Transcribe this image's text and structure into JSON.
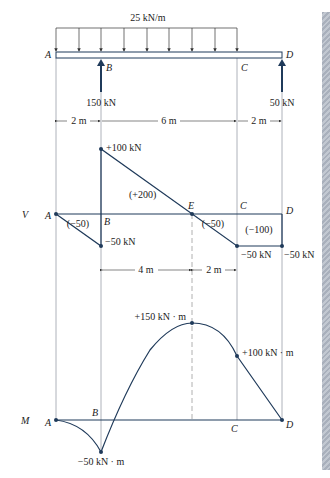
{
  "load": {
    "label": "25 kN/m"
  },
  "points": {
    "A": "A",
    "B": "B",
    "C": "C",
    "D": "D",
    "E": "E"
  },
  "reactions": {
    "B": "150 kN",
    "D": "50 kN"
  },
  "dimensions": {
    "AB": "2 m",
    "BC": "6 m",
    "CD": "2 m",
    "BE": "4 m",
    "EC": "2 m"
  },
  "shear": {
    "axis_label": "V",
    "values": {
      "B_top": "+100 kN",
      "B_bottom": "−50 kN",
      "C": "−50 kN",
      "D": "−50 kN"
    },
    "areas": {
      "AB": "(−50)",
      "BE": "(+200)",
      "EC": "(−50)",
      "CD": "(−100)"
    }
  },
  "moment": {
    "axis_label": "M",
    "values": {
      "B": "−50 kN · m",
      "E": "+150 kN · m",
      "C": "+100 kN · m"
    }
  },
  "colors": {
    "line": "#1f3a5a",
    "guide": "#9aa0a8",
    "dashed": "#b0b0b0"
  }
}
